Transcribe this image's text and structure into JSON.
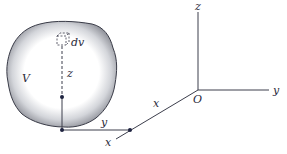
{
  "diagram": {
    "type": "volume-element-coordinates",
    "body": {
      "label": "V",
      "fill_edge": "#8e9098",
      "outline": "#3a3c48"
    },
    "element": {
      "label": "dv"
    },
    "distances": {
      "z": "z",
      "y": "y",
      "x": "x"
    },
    "axes": {
      "origin": "O",
      "x": "x",
      "y": "y",
      "z": "z"
    },
    "colors": {
      "line": "#3c3e4c",
      "point": "#1e2340",
      "text": "#2a2a3a"
    }
  }
}
